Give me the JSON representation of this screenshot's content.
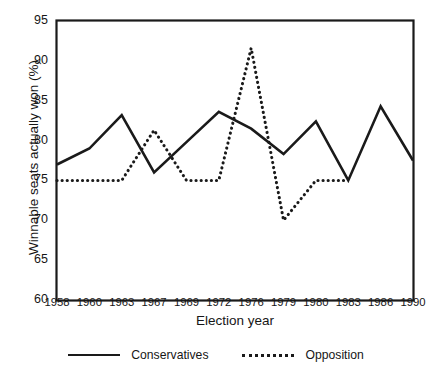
{
  "chart_data": {
    "type": "line",
    "title": "",
    "xlabel": "Election year",
    "ylabel": "Winnable seats actually won (%)",
    "categories": [
      "1958",
      "1960",
      "1963",
      "1967",
      "1969",
      "1972",
      "1976",
      "1979",
      "1980",
      "1983",
      "1986",
      "1990"
    ],
    "xticklabels": [
      "1958",
      "1960",
      "1963",
      "1967",
      "1969",
      "1972",
      "1976",
      "1979",
      "1980",
      "1983",
      "1986",
      "1990"
    ],
    "yticklabels": [
      "60",
      "65",
      "70",
      "75",
      "80",
      "85",
      "90",
      "95"
    ],
    "ylim": [
      60,
      95
    ],
    "ytick_step": 5,
    "grid": false,
    "legend_position": "bottom-center",
    "series": [
      {
        "name": "Conservatives",
        "style": "solid",
        "color": "#1a1a1a",
        "values": [
          77.0,
          79.0,
          83.2,
          76.0,
          79.8,
          83.6,
          81.5,
          78.3,
          82.4,
          75.0,
          84.3,
          77.5
        ]
      },
      {
        "name": "Opposition",
        "style": "dotted",
        "color": "#1a1a1a",
        "values": [
          75.0,
          75.0,
          75.0,
          81.3,
          75.0,
          75.0,
          91.6,
          70.0,
          75.0,
          75.0,
          null,
          null
        ]
      }
    ]
  },
  "legend": {
    "entries": [
      {
        "label": "Conservatives",
        "style": "solid"
      },
      {
        "label": "Opposition",
        "style": "dotted"
      }
    ]
  },
  "axes": {
    "x_title": "Election year",
    "y_title": "Winnable seats actually won (%)"
  }
}
